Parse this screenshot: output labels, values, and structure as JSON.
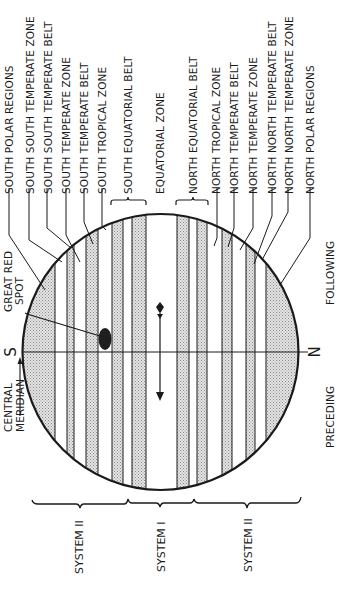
{
  "zone_labels": [
    {
      "id": "spr",
      "label": "SOUTH POLAR REGIONS"
    },
    {
      "id": "sstz",
      "label": "SOUTH SOUTH TEMPERATE ZONE"
    },
    {
      "id": "sstb",
      "label": "SOUTH SOUTH TEMPERATE BELT"
    },
    {
      "id": "stz",
      "label": "SOUTH TEMPERATE ZONE"
    },
    {
      "id": "stb",
      "label": "SOUTH TEMPERATE BELT"
    },
    {
      "id": "stropz",
      "label": "SOUTH TROPICAL ZONE"
    },
    {
      "id": "seb",
      "label": "SOUTH EQUATORIAL BELT"
    },
    {
      "id": "ez",
      "label": "EQUATORIAL ZONE"
    },
    {
      "id": "neb",
      "label": "NORTH EQUATORIAL BELT"
    },
    {
      "id": "ntropz",
      "label": "NORTH TROPICAL ZONE"
    },
    {
      "id": "ntb",
      "label": "NORTH TEMPERATE BELT"
    },
    {
      "id": "ntz",
      "label": "NORTH TEMPERATE ZONE"
    },
    {
      "id": "nntb",
      "label": "NORTH NORTH TEMPERATE BELT"
    },
    {
      "id": "nntz",
      "label": "NORTH NORTH TEMPERATE ZONE"
    },
    {
      "id": "npr",
      "label": "NORTH POLAR REGIONS"
    }
  ],
  "features": {
    "great_red_spot": "GREAT RED SPOT",
    "great_red_spot_line1": "GREAT RED",
    "great_red_spot_line2": "SPOT",
    "central_meridian_line1": "CENTRAL",
    "central_meridian_line2": "MERIDIAN"
  },
  "poles": {
    "south": "S",
    "north": "N"
  },
  "directions": {
    "following": "FOLLOWING",
    "preceding": "PRECEDING"
  },
  "systems": [
    {
      "id": "sys2-south",
      "label": "SYSTEM II"
    },
    {
      "id": "sys1",
      "label": "SYSTEM I"
    },
    {
      "id": "sys2-north",
      "label": "SYSTEM II"
    }
  ],
  "colors": {
    "ink": "#1a1a1a",
    "belt_shade": "#cfcfcf",
    "background": "#ffffff"
  },
  "bands": [
    {
      "x0": 23,
      "x1": 55,
      "shaded": true
    },
    {
      "x0": 55,
      "x1": 67,
      "shaded": false
    },
    {
      "x0": 67,
      "x1": 74,
      "shaded": true
    },
    {
      "x0": 74,
      "x1": 86,
      "shaded": false
    },
    {
      "x0": 86,
      "x1": 98,
      "shaded": true
    },
    {
      "x0": 98,
      "x1": 112,
      "shaded": false
    },
    {
      "x0": 112,
      "x1": 123,
      "shaded": true
    },
    {
      "x0": 123,
      "x1": 132,
      "shaded": false
    },
    {
      "x0": 132,
      "x1": 146,
      "shaded": true
    },
    {
      "x0": 146,
      "x1": 177,
      "shaded": false
    },
    {
      "x0": 177,
      "x1": 189,
      "shaded": true
    },
    {
      "x0": 189,
      "x1": 197,
      "shaded": false
    },
    {
      "x0": 197,
      "x1": 207,
      "shaded": true
    },
    {
      "x0": 207,
      "x1": 222,
      "shaded": false
    },
    {
      "x0": 222,
      "x1": 232,
      "shaded": true
    },
    {
      "x0": 232,
      "x1": 246,
      "shaded": false
    },
    {
      "x0": 246,
      "x1": 255,
      "shaded": true
    },
    {
      "x0": 255,
      "x1": 266,
      "shaded": false
    },
    {
      "x0": 266,
      "x1": 298,
      "shaded": true
    }
  ]
}
